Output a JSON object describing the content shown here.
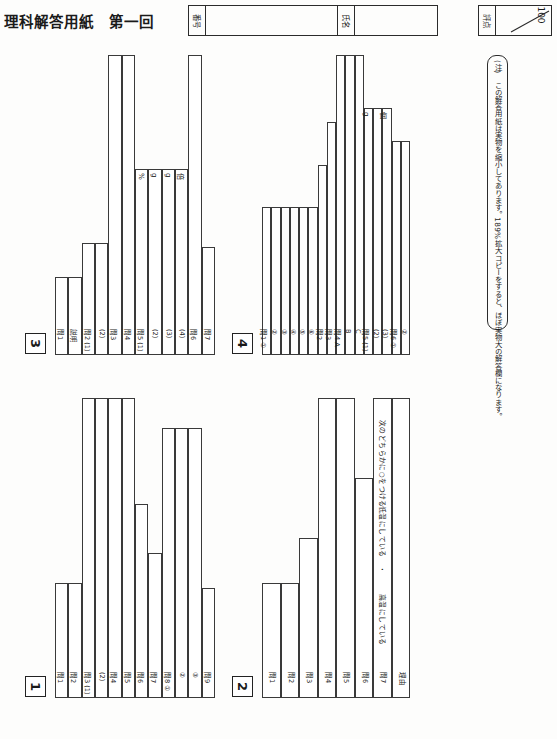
{
  "header": {
    "title": "理科解答用紙　第一回",
    "id_label": "番号",
    "name_label": "氏名",
    "score_label": "評点",
    "score_total": "100"
  },
  "note": {
    "text": "(注)　この解答用紙は実物を縮小してあります。189%拡大コピーをすると、ほぼ実物大の解答欄になります。"
  },
  "sections": [
    {
      "number": "3",
      "rows": [
        {
          "label": "問1",
          "unit": ""
        },
        {
          "label": "説明",
          "unit": ""
        },
        {
          "label": "問2 (1)",
          "unit": ""
        },
        {
          "label": "(2)",
          "unit": ""
        },
        {
          "label": "問3",
          "unit": ""
        },
        {
          "label": "問4",
          "unit": ""
        },
        {
          "label": "問5 (1)",
          "unit": "%"
        },
        {
          "label": "(2)",
          "unit": "g"
        },
        {
          "label": "(3)",
          "unit": "g"
        },
        {
          "label": "(4)",
          "unit": "倍"
        },
        {
          "label": "問6",
          "unit": ""
        },
        {
          "label": "問7",
          "unit": ""
        }
      ]
    },
    {
      "number": "4",
      "rows": [
        {
          "label": "問1 ①",
          "unit": ""
        },
        {
          "label": "②",
          "unit": ""
        },
        {
          "label": "③",
          "unit": ""
        },
        {
          "label": "④",
          "unit": ""
        },
        {
          "label": "⑤",
          "unit": ""
        },
        {
          "label": "⑥",
          "unit": ""
        },
        {
          "label": "問2",
          "unit": ""
        },
        {
          "label": "問3",
          "unit": ""
        },
        {
          "label": "問4 A",
          "unit": ""
        },
        {
          "label": "B",
          "unit": ""
        },
        {
          "label": "C",
          "unit": ""
        },
        {
          "label": "問5 (1)",
          "unit": "g"
        },
        {
          "label": "(2)",
          "unit": ""
        },
        {
          "label": "(3)",
          "unit": "個"
        },
        {
          "label": "問6 ①",
          "unit": ""
        },
        {
          "label": "②",
          "unit": ""
        }
      ]
    },
    {
      "number": "1",
      "rows": [
        {
          "label": "問1",
          "unit": ""
        },
        {
          "label": "問2",
          "unit": ""
        },
        {
          "label": "問3 (1)",
          "unit": ""
        },
        {
          "label": "(2)",
          "unit": ""
        },
        {
          "label": "問4",
          "unit": ""
        },
        {
          "label": "問5",
          "unit": ""
        },
        {
          "label": "問6",
          "unit": ""
        },
        {
          "label": "問7",
          "unit": ""
        },
        {
          "label": "問8 ①",
          "unit": ""
        },
        {
          "label": "②",
          "unit": ""
        },
        {
          "label": "③",
          "unit": ""
        },
        {
          "label": "問9",
          "unit": ""
        }
      ]
    },
    {
      "number": "2",
      "rows": [
        {
          "label": "問1",
          "unit": ""
        },
        {
          "label": "問2",
          "unit": ""
        },
        {
          "label": "問3",
          "unit": ""
        },
        {
          "label": "問4",
          "unit": ""
        },
        {
          "label": "問5",
          "unit": ""
        },
        {
          "label": "問6",
          "unit": ""
        },
        {
          "label": "問7",
          "unit": ""
        },
        {
          "label": "理由",
          "unit": ""
        }
      ],
      "q7_instruction": "次のどちらかに○をつける",
      "q7_choice_a": "高温にしている",
      "q7_choice_sep": "・",
      "q7_choice_b": "低温にしている"
    }
  ]
}
